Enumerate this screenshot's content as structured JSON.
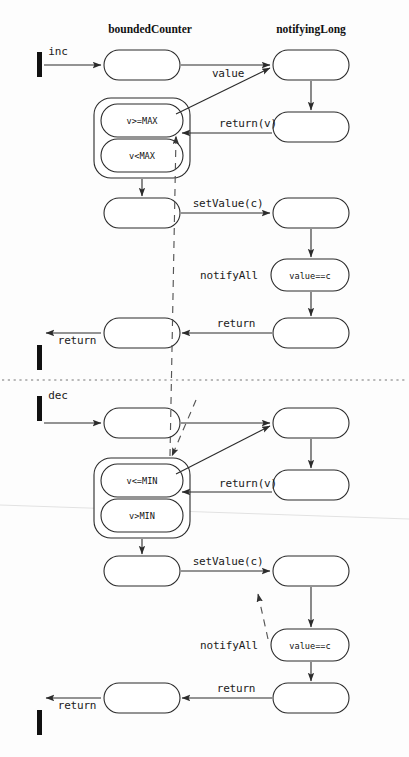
{
  "canvas": {
    "width": 409,
    "height": 757,
    "background": "#fdfdfd"
  },
  "colors": {
    "stroke": "#2b2b2b",
    "dashed": "#555555",
    "separator": "#777777",
    "text": "#111111",
    "fill": "#ffffff"
  },
  "lanes": [
    {
      "id": "lane-bounded-counter",
      "title": "boundedCounter",
      "x": 150,
      "y": 33
    },
    {
      "id": "lane-notifying-long",
      "title": "notifyingLong",
      "x": 311,
      "y": 33
    }
  ],
  "sections": [
    {
      "id": "section-inc",
      "trigger": "inc"
    },
    {
      "id": "section-dec",
      "trigger": "dec"
    }
  ],
  "separator": {
    "y": 380,
    "x1": 2,
    "x2": 407
  },
  "triggers": [
    {
      "id": "trigger-inc",
      "label": "inc",
      "label_x": 58,
      "label_y": 55,
      "bar_x": 37,
      "bar_y": 52,
      "bar_w": 5,
      "bar_h": 25
    },
    {
      "id": "trigger-dec",
      "label": "dec",
      "label_x": 58,
      "label_y": 399,
      "bar_x": 37,
      "bar_y": 396,
      "bar_w": 5,
      "bar_h": 25
    }
  ],
  "returns_out": [
    {
      "id": "return-out-inc",
      "label": "return",
      "label_x": 77,
      "label_y": 344,
      "bar_x": 37,
      "bar_y": 345,
      "bar_w": 5,
      "bar_h": 25
    },
    {
      "id": "return-out-dec",
      "label": "return",
      "label_x": 77,
      "label_y": 709,
      "bar_x": 37,
      "bar_y": 710,
      "bar_w": 5,
      "bar_h": 25
    }
  ],
  "activations": [
    {
      "id": "act-inc-entry",
      "x": 104,
      "y": 50,
      "w": 76,
      "h": 30
    },
    {
      "id": "act-inc-notify-1",
      "x": 273,
      "y": 50,
      "w": 76,
      "h": 30
    },
    {
      "id": "act-inc-notify-2",
      "x": 273,
      "y": 112,
      "w": 76,
      "h": 30
    },
    {
      "id": "act-inc-setvalue",
      "x": 104,
      "y": 198,
      "w": 76,
      "h": 30
    },
    {
      "id": "act-inc-nl-set",
      "x": 273,
      "y": 198,
      "w": 76,
      "h": 30
    },
    {
      "id": "act-inc-nl-return",
      "x": 273,
      "y": 318,
      "w": 76,
      "h": 30
    },
    {
      "id": "act-inc-exit",
      "x": 104,
      "y": 318,
      "w": 76,
      "h": 30
    },
    {
      "id": "act-dec-entry",
      "x": 104,
      "y": 408,
      "w": 76,
      "h": 30
    },
    {
      "id": "act-dec-notify-1",
      "x": 273,
      "y": 408,
      "w": 76,
      "h": 30
    },
    {
      "id": "act-dec-notify-2",
      "x": 273,
      "y": 470,
      "w": 76,
      "h": 30
    },
    {
      "id": "act-dec-setvalue",
      "x": 104,
      "y": 556,
      "w": 76,
      "h": 30
    },
    {
      "id": "act-dec-nl-set",
      "x": 273,
      "y": 556,
      "w": 76,
      "h": 30
    },
    {
      "id": "act-dec-nl-return",
      "x": 273,
      "y": 683,
      "w": 76,
      "h": 30
    },
    {
      "id": "act-dec-exit",
      "x": 104,
      "y": 683,
      "w": 76,
      "h": 30
    }
  ],
  "composite_states": [
    {
      "id": "composite-inc-guard",
      "x": 94,
      "y": 98,
      "w": 96,
      "h": 80,
      "inner": [
        {
          "id": "state-v-ge-max",
          "label": "v>=MAX",
          "x": 101,
          "y": 104,
          "w": 82,
          "h": 33
        },
        {
          "id": "state-v-lt-max",
          "label": "v<MAX",
          "x": 101,
          "y": 139,
          "w": 82,
          "h": 33
        }
      ]
    },
    {
      "id": "composite-dec-guard",
      "x": 94,
      "y": 458,
      "w": 96,
      "h": 80,
      "inner": [
        {
          "id": "state-v-le-min",
          "label": "v<=MIN",
          "x": 101,
          "y": 464,
          "w": 82,
          "h": 33
        },
        {
          "id": "state-v-gt-min",
          "label": "v>MIN",
          "x": 101,
          "y": 499,
          "w": 82,
          "h": 33
        }
      ]
    }
  ],
  "value_states": [
    {
      "id": "state-value-eq-c-inc",
      "label": "value==c",
      "x": 271,
      "y": 259,
      "w": 78,
      "h": 32,
      "label_x": 310,
      "label_y": 279
    },
    {
      "id": "state-value-eq-c-dec",
      "label": "value==c",
      "x": 271,
      "y": 629,
      "w": 78,
      "h": 32,
      "label_x": 310,
      "label_y": 649
    }
  ],
  "messages": [
    {
      "id": "msg-inc-value",
      "label": "value",
      "x": 228,
      "y": 77
    },
    {
      "id": "msg-inc-returnv",
      "label": "return(v)",
      "x": 248,
      "y": 127
    },
    {
      "id": "msg-inc-setvalue",
      "label": "setValue(c)",
      "x": 228,
      "y": 207
    },
    {
      "id": "msg-inc-notifyall",
      "label": "notifyAll",
      "x": 229,
      "y": 279
    },
    {
      "id": "msg-inc-return",
      "label": "return",
      "x": 236,
      "y": 327
    },
    {
      "id": "msg-dec-value",
      "label": "",
      "x": 228,
      "y": 437
    },
    {
      "id": "msg-dec-returnv",
      "label": "return(v)",
      "x": 248,
      "y": 487
    },
    {
      "id": "msg-dec-setvalue",
      "label": "setValue(c)",
      "x": 228,
      "y": 565
    },
    {
      "id": "msg-dec-notifyall",
      "label": "notifyAll",
      "x": 229,
      "y": 649
    },
    {
      "id": "msg-dec-return",
      "label": "return",
      "x": 236,
      "y": 692
    }
  ],
  "arrows": [
    {
      "id": "arrow-inc-trigger",
      "x1": 44,
      "y1": 65,
      "x2": 101,
      "y2": 65,
      "head": "solid"
    },
    {
      "id": "arrow-inc-value",
      "x1": 181,
      "y1": 65,
      "x2": 270,
      "y2": 65,
      "head": "solid"
    },
    {
      "id": "arrow-inc-guard-up",
      "x1": 176,
      "y1": 114,
      "x2": 270,
      "y2": 68,
      "head": "solid"
    },
    {
      "id": "arrow-inc-nl-down",
      "x1": 311,
      "y1": 81,
      "x2": 311,
      "y2": 110,
      "head": "solid"
    },
    {
      "id": "arrow-inc-returnv",
      "x1": 272,
      "y1": 133,
      "x2": 182,
      "y2": 133,
      "head": "solid"
    },
    {
      "id": "arrow-inc-guard-dn",
      "x1": 142,
      "y1": 179,
      "x2": 142,
      "y2": 196,
      "head": "solid"
    },
    {
      "id": "arrow-inc-setvalue",
      "x1": 181,
      "y1": 213,
      "x2": 270,
      "y2": 213,
      "head": "solid"
    },
    {
      "id": "arrow-inc-nl-set-dn",
      "x1": 311,
      "y1": 229,
      "x2": 311,
      "y2": 257,
      "head": "solid"
    },
    {
      "id": "arrow-inc-value-dn",
      "x1": 311,
      "y1": 292,
      "x2": 311,
      "y2": 316,
      "head": "solid"
    },
    {
      "id": "arrow-inc-return",
      "x1": 272,
      "y1": 333,
      "x2": 182,
      "y2": 333,
      "head": "solid"
    },
    {
      "id": "arrow-inc-return-out",
      "x1": 101,
      "y1": 333,
      "x2": 46,
      "y2": 333,
      "head": "solid"
    },
    {
      "id": "arrow-dec-trigger",
      "x1": 44,
      "y1": 423,
      "x2": 101,
      "y2": 423,
      "head": "solid"
    },
    {
      "id": "arrow-dec-value",
      "x1": 181,
      "y1": 423,
      "x2": 270,
      "y2": 423,
      "head": "solid"
    },
    {
      "id": "arrow-dec-guard-up",
      "x1": 176,
      "y1": 474,
      "x2": 270,
      "y2": 426,
      "head": "solid"
    },
    {
      "id": "arrow-dec-nl-down",
      "x1": 311,
      "y1": 439,
      "x2": 311,
      "y2": 468,
      "head": "solid"
    },
    {
      "id": "arrow-dec-returnv",
      "x1": 272,
      "y1": 492,
      "x2": 182,
      "y2": 492,
      "head": "solid"
    },
    {
      "id": "arrow-dec-guard-dn",
      "x1": 142,
      "y1": 539,
      "x2": 142,
      "y2": 554,
      "head": "solid"
    },
    {
      "id": "arrow-dec-setvalue",
      "x1": 181,
      "y1": 571,
      "x2": 270,
      "y2": 571,
      "head": "solid"
    },
    {
      "id": "arrow-dec-nl-set-dn",
      "x1": 311,
      "y1": 587,
      "x2": 311,
      "y2": 627,
      "head": "solid"
    },
    {
      "id": "arrow-dec-value-dn",
      "x1": 311,
      "y1": 662,
      "x2": 311,
      "y2": 681,
      "head": "solid"
    },
    {
      "id": "arrow-dec-return",
      "x1": 272,
      "y1": 698,
      "x2": 182,
      "y2": 698,
      "head": "solid"
    },
    {
      "id": "arrow-dec-return-out",
      "x1": 101,
      "y1": 698,
      "x2": 46,
      "y2": 698,
      "head": "solid"
    }
  ],
  "dashed_arrows": [
    {
      "id": "dashed-inc-notifyall",
      "x1": 170,
      "y1": 456,
      "x2": 176,
      "y2": 136,
      "head": "solid",
      "desc": "notifyAll from dec notifyingLong to inc guard"
    },
    {
      "id": "dashed-dec-notifyall",
      "x1": 268,
      "y1": 639,
      "x2": 258,
      "y2": 594,
      "head": "solid",
      "desc": "notifyAll from dec value state to dec setValue activation"
    },
    {
      "id": "dashed-inc-into-dec-guard",
      "x1": 196,
      "y1": 400,
      "x2": 172,
      "y2": 456,
      "head": "solid",
      "desc": "dashed continuation into lower guard"
    }
  ],
  "smudges": [
    {
      "id": "smudge-scan-line",
      "x1": 0,
      "y1": 505,
      "x2": 409,
      "y2": 519
    }
  ]
}
